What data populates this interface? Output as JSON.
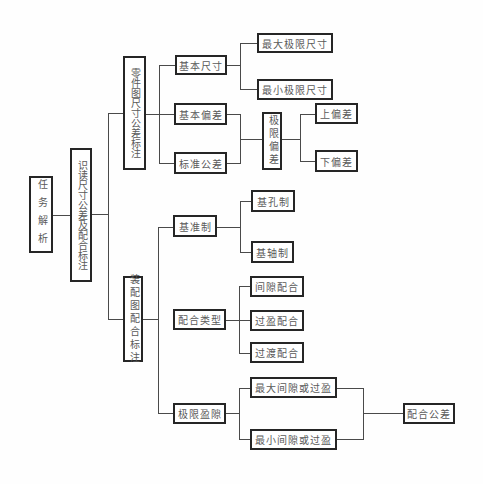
{
  "diagram": {
    "root": {
      "label": "任务解析"
    },
    "main": {
      "label": "识读尺寸公差及配合标注"
    },
    "part_drawing": {
      "label": "零件图尺寸公差标注",
      "basic_size": {
        "label": "基本尺寸",
        "children": [
          "最大极限尺寸",
          "最小极限尺寸"
        ]
      },
      "fundamental_deviation": {
        "label": "基本偏差"
      },
      "standard_tolerance": {
        "label": "标准公差"
      },
      "limit_deviation": {
        "label": "极限偏差",
        "children": [
          "上偏差",
          "下偏差"
        ]
      }
    },
    "assembly_drawing": {
      "label": "装配图配合标注",
      "fit_system": {
        "label": "基准制",
        "children": [
          "基孔制",
          "基轴制"
        ]
      },
      "fit_type": {
        "label": "配合类型",
        "children": [
          "间隙配合",
          "过盈配合",
          "过渡配合"
        ]
      },
      "limit_clearance": {
        "label": "极限盈隙",
        "children": [
          "最大间隙或过盈",
          "最小间隙或过盈"
        ]
      },
      "fit_tolerance": {
        "label": "配合公差"
      }
    }
  },
  "colors": {
    "background": "#ffffff",
    "box_border": "#262626",
    "text": "#5a5a5a",
    "connector": "#4a4a4a"
  }
}
